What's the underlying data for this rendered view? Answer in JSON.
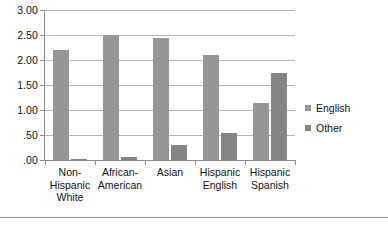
{
  "chart_data": {
    "type": "bar",
    "title": "",
    "subtitle": "",
    "xlabel": "",
    "ylabel": "",
    "categories": [
      "Non-Hispanic White",
      "African-American",
      "Asian",
      "Hispanic English",
      "Hispanic Spanish"
    ],
    "category_lines": [
      [
        "Non-",
        "Hispanic",
        "White"
      ],
      [
        "African-",
        "American"
      ],
      [
        "Asian"
      ],
      [
        "Hispanic",
        "English"
      ],
      [
        "Hispanic",
        "Spanish"
      ]
    ],
    "series": [
      {
        "name": "English",
        "color": "#969696",
        "values": [
          2.2,
          2.5,
          2.45,
          2.1,
          1.15
        ]
      },
      {
        "name": "Other",
        "color": "#848484",
        "values": [
          0.03,
          0.06,
          0.3,
          0.55,
          1.75
        ]
      }
    ],
    "ylim": [
      0,
      3.0
    ],
    "yticks": [
      0,
      0.5,
      1.0,
      1.5,
      2.0,
      2.5,
      3.0
    ],
    "ytick_labels": [
      ".00",
      ".50",
      "1.00",
      "1.50",
      "2.00",
      "2.50",
      "3.00"
    ],
    "grid": true,
    "legend_position": "right"
  },
  "legend": {
    "items": [
      {
        "label": "English"
      },
      {
        "label": "Other"
      }
    ]
  },
  "colors": {
    "series_english": "#969696",
    "series_other": "#848484",
    "gridline": "#b4b4b4",
    "axis": "#8d8d8d",
    "text": "#111111",
    "background": "#ffffff"
  }
}
